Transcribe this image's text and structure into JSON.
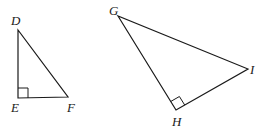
{
  "figure": {
    "background": "#ffffff",
    "stroke_color": "#1a1a1a",
    "triangles": [
      {
        "name": "DEF",
        "right_angle_at": "E",
        "vertices": {
          "D": {
            "label": "D",
            "x": 18,
            "y": 30
          },
          "E": {
            "label": "E",
            "x": 18,
            "y": 98
          },
          "F": {
            "label": "F",
            "x": 68,
            "y": 97
          }
        }
      },
      {
        "name": "GHI",
        "right_angle_at": "H",
        "vertices": {
          "G": {
            "label": "G",
            "x": 118,
            "y": 16
          },
          "H": {
            "label": "H",
            "x": 176,
            "y": 110
          },
          "I": {
            "label": "I",
            "x": 248,
            "y": 69
          }
        }
      }
    ]
  }
}
